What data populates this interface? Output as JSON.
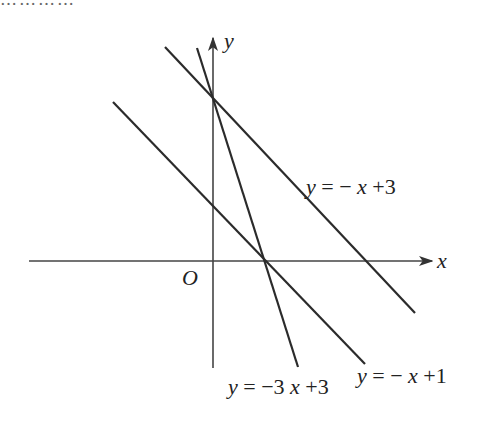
{
  "header": {
    "cut_off_text": "…………"
  },
  "axes": {
    "x_label": "x",
    "y_label": "y",
    "origin_label": "O",
    "origin_px": [
      213,
      261
    ],
    "unit_px_x": 51,
    "unit_px_y": 53,
    "color": "#333333"
  },
  "lines": [
    {
      "id": "line-a",
      "equation": "y = −x+3",
      "label_y": "y",
      "label_rest": " = −x+3",
      "slope": -1,
      "intercept": 3,
      "color": "#2b2b2b"
    },
    {
      "id": "line-b",
      "equation": "y = −3x+3",
      "label_y": "y",
      "label_rest": " = −3x+3",
      "slope": -3,
      "intercept": 3,
      "color": "#2b2b2b"
    },
    {
      "id": "line-c",
      "equation": "y = −x+1",
      "label_y": "y",
      "label_rest": " = −x+1",
      "slope": -1,
      "intercept": 1,
      "color": "#2b2b2b"
    }
  ],
  "labels": {
    "line_a": {
      "y": "y",
      "eq": "= −",
      "x": "x",
      "tail": "+3"
    },
    "line_b": {
      "y": "y",
      "eq": "= −3",
      "x": "x",
      "tail": "+3"
    },
    "line_c": {
      "y": "y",
      "eq": "= −",
      "x": "x",
      "tail": "+1"
    }
  }
}
